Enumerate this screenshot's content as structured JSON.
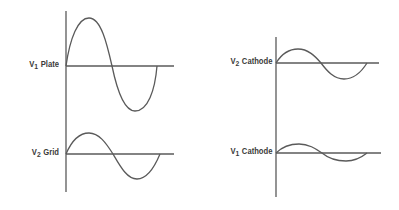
{
  "diagram": {
    "stroke_color": "#5a5a5a",
    "panels": [
      {
        "id": "v1-plate",
        "label_prefix": "V",
        "label_sub": "1",
        "label_text": "Plate",
        "relative_amplitude": "large",
        "phase": "in-phase start"
      },
      {
        "id": "v2-grid",
        "label_prefix": "V",
        "label_sub": "2",
        "label_text": "Grid",
        "relative_amplitude": "medium"
      },
      {
        "id": "v2-cathode",
        "label_prefix": "V",
        "label_sub": "2",
        "label_text": "Cathode",
        "relative_amplitude": "medium-small"
      },
      {
        "id": "v1-cathode",
        "label_prefix": "V",
        "label_sub": "1",
        "label_text": "Cathode",
        "relative_amplitude": "small"
      }
    ]
  }
}
